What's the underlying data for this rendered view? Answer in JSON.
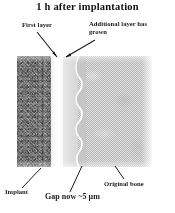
{
  "figure": {
    "title": "1 h after implantation",
    "panel": {
      "regions": [
        {
          "name": "implant",
          "label": "Implant",
          "appearance": "coarse speckled gray"
        },
        {
          "name": "gap",
          "label": "Gap now ~5 µm",
          "appearance": "bright white band"
        },
        {
          "name": "additional-layer",
          "label": "Additional layer has\ngrown",
          "appearance": "pale smooth gray"
        },
        {
          "name": "original-bone",
          "label": "Original bone",
          "appearance": "fine dithered halftone gray"
        }
      ]
    },
    "callouts": {
      "first_layer": "First layer",
      "additional_layer": "Additional layer has\ngrown",
      "implant": "Implant",
      "gap": "Gap now ~5 µm",
      "original_bone": "Original bone"
    },
    "colors": {
      "background": "#ffffff",
      "text": "#1a1a1a",
      "implant_gray": "#9c9c9c",
      "gap_white": "#ffffff",
      "new_layer_gray": "#dedede",
      "bone_gray": "#cfcfcf",
      "leader_line": "#1a1a1a"
    }
  }
}
